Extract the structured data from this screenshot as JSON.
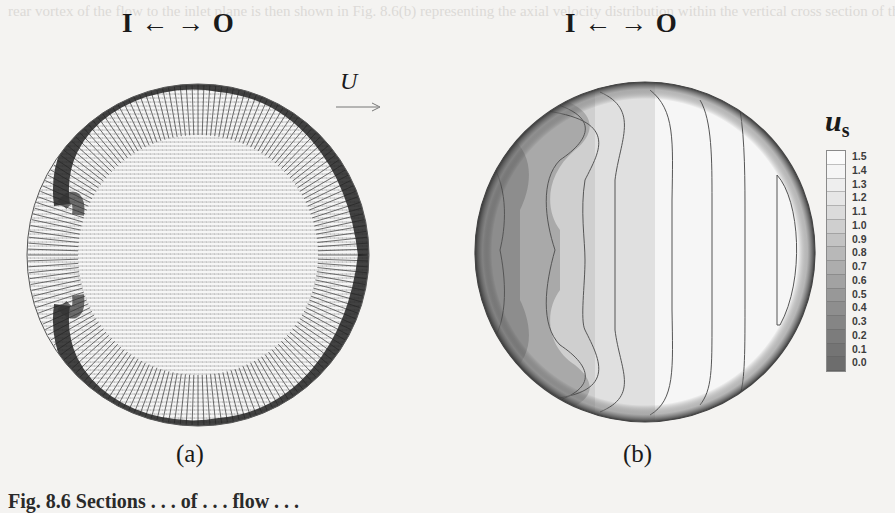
{
  "figure": {
    "bleed_through_text": "rear vortex of the flow to the inlet plane is then shown in Fig. 8.6(b) representing the axial velocity distribution within the vertical cross section of the pipeline for the simulated flow obtained by the LES computation process",
    "panel_a": {
      "title": "I ← → O",
      "label": "(a)",
      "type": "velocity vector field",
      "description": "radial velocity vectors in pipe cross-section with dark high-velocity band along wall"
    },
    "panel_b": {
      "title": "I ← → O",
      "label": "(b)",
      "type": "contour plot"
    },
    "flow_label": "U",
    "flow_direction": "right-arrow",
    "colorbar": {
      "variable": "u",
      "subscript": "s",
      "ticks": [
        "1.5",
        "1.4",
        "1.3",
        "1.2",
        "1.1",
        "1.0",
        "0.9",
        "0.8",
        "0.7",
        "0.6",
        "0.5",
        "0.4",
        "0.3",
        "0.2",
        "0.1",
        "0.0"
      ],
      "colors": [
        "#fbfbfb",
        "#f5f5f5",
        "#eeeeee",
        "#e6e6e6",
        "#dbdbdb",
        "#cfcfcf",
        "#c3c3c3",
        "#b8b8b8",
        "#adadad",
        "#a2a2a2",
        "#989898",
        "#8e8e8e",
        "#858585",
        "#7c7c7c",
        "#747474",
        "#6d6d6d"
      ]
    },
    "caption": "Fig. 8.6  Sections . . . of . . . flow . . ."
  },
  "chart_data": {
    "type": "heatmap",
    "title": "",
    "panels": [
      "(a) velocity vectors",
      "(b) contours of u_s"
    ],
    "legend": {
      "label": "u_s",
      "range": [
        0.0,
        1.5
      ],
      "step": 0.1,
      "position": "right"
    },
    "annotations": [
      "I ← → O",
      "U →"
    ]
  }
}
